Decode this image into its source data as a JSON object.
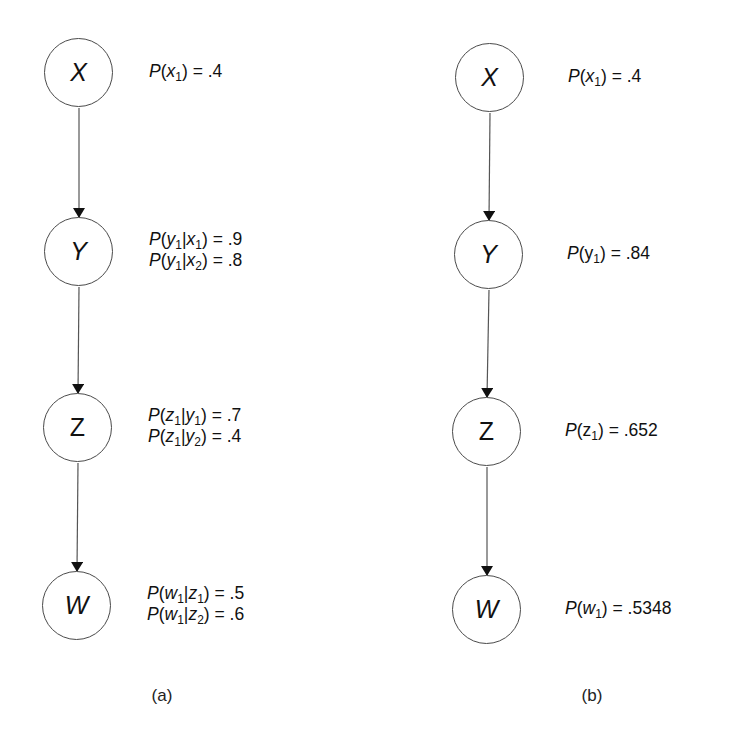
{
  "diagrams": [
    {
      "caption": "(a)",
      "nodes": [
        {
          "id": "X",
          "label": "X",
          "cx": 79,
          "cy": 73,
          "probabilities": [
            {
              "text_html": "<i>P</i>(<i>x</i><sub>1</sub>) = .4",
              "plain": "P(x1) = .4"
            }
          ]
        },
        {
          "id": "Y",
          "label": "Y",
          "cx": 79,
          "cy": 252,
          "probabilities": [
            {
              "text_html": "<i>P</i>(<i>y</i><sub>1</sub>|<i>x</i><sub>1</sub>) = .9",
              "plain": "P(y1|x1) = .9"
            },
            {
              "text_html": "<i>P</i>(<i>y</i><sub>1</sub>|<i>x</i><sub>2</sub>) = .8",
              "plain": "P(y1|x2) = .8"
            }
          ]
        },
        {
          "id": "Z",
          "label": "Z",
          "cx": 78,
          "cy": 428,
          "probabilities": [
            {
              "text_html": "<i>P</i>(<i>z</i><sub>1</sub>|<i>y</i><sub>1</sub>) = .7",
              "plain": "P(z1|y1) = .7"
            },
            {
              "text_html": "<i>P</i>(<i>z</i><sub>1</sub>|<i>y</i><sub>2</sub>) = .4",
              "plain": "P(z1|y2) = .4"
            }
          ]
        },
        {
          "id": "W",
          "label": "W",
          "cx": 77,
          "cy": 606,
          "probabilities": [
            {
              "text_html": "<i>P</i>(<i>w</i><sub>1</sub>|<i>z</i><sub>1</sub>) = .5",
              "plain": "P(w1|z1) = .5"
            },
            {
              "text_html": "<i>P</i>(<i>w</i><sub>1</sub>|<i>z</i><sub>2</sub>) = .6",
              "plain": "P(w1|z2) = .6"
            }
          ]
        }
      ],
      "edges": [
        [
          "X",
          "Y"
        ],
        [
          "Y",
          "Z"
        ],
        [
          "Z",
          "W"
        ]
      ]
    },
    {
      "caption": "(b)",
      "nodes": [
        {
          "id": "X",
          "label": "X",
          "cx": 490,
          "cy": 78,
          "probabilities": [
            {
              "text_html": "<i>P</i>(<i>x</i><sub>1</sub>) = .4",
              "plain": "P(x1) = .4"
            }
          ]
        },
        {
          "id": "Y",
          "label": "Y",
          "cx": 489,
          "cy": 255,
          "probabilities": [
            {
              "text_html": "<i>P</i>(y<sub>1</sub>) = .84",
              "plain": "P(y1) = .84"
            }
          ]
        },
        {
          "id": "Z",
          "label": "Z",
          "cx": 487,
          "cy": 432,
          "probabilities": [
            {
              "text_html": "<i>P</i>(z<sub>1</sub>) = .652",
              "plain": "P(z1) = .652"
            }
          ]
        },
        {
          "id": "W",
          "label": "W",
          "cx": 487,
          "cy": 610,
          "probabilities": [
            {
              "text_html": "<i>P</i>(<i>w</i><sub>1</sub>) = .5348",
              "plain": "P(w1) = .5348"
            }
          ]
        }
      ],
      "edges": [
        [
          "X",
          "Y"
        ],
        [
          "Y",
          "Z"
        ],
        [
          "Z",
          "W"
        ]
      ]
    }
  ],
  "colors": {
    "stroke": "#4a4a4a",
    "arrow": "#111111",
    "text": "#111111",
    "background": "#ffffff"
  }
}
